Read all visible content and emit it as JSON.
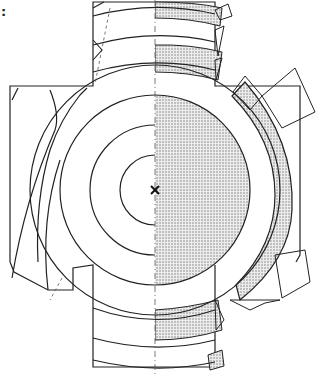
{
  "figure": {
    "label": ":",
    "center_marker": "×",
    "colors": {
      "line": "#222222",
      "fill": "#d6d6d6",
      "background": "#ffffff"
    },
    "center": [
      155,
      190
    ],
    "ring_radii": [
      35,
      65,
      95,
      125,
      150
    ]
  }
}
